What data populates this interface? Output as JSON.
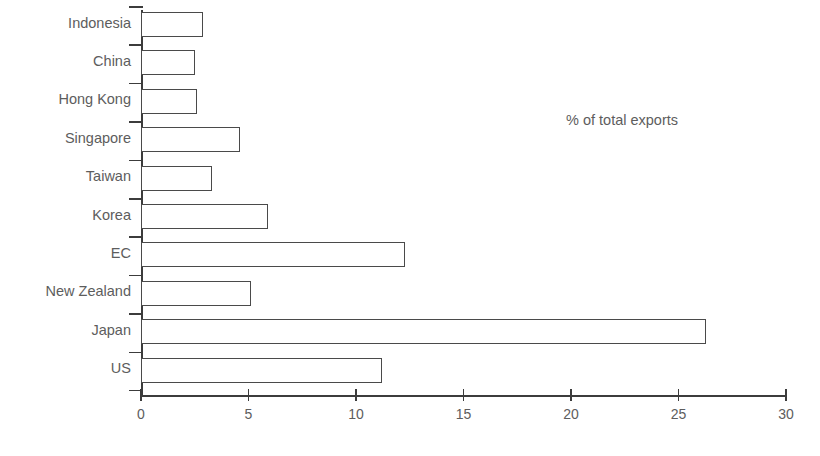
{
  "chart_data": {
    "type": "bar",
    "orientation": "horizontal",
    "title": "",
    "xlabel": "",
    "ylabel": "",
    "annotation": "% of total exports",
    "xlim": [
      0,
      30
    ],
    "xticks": [
      0,
      5,
      10,
      15,
      20,
      25,
      30
    ],
    "xtick_labels": [
      "0",
      "5",
      "10",
      "15",
      "20",
      "25",
      "30"
    ],
    "grid": false,
    "legend": false,
    "categories": [
      "Indonesia",
      "China",
      "Hong Kong",
      "Singapore",
      "Taiwan",
      "Korea",
      "EC",
      "New Zealand",
      "Japan",
      "US"
    ],
    "values": [
      2.9,
      2.5,
      2.6,
      4.6,
      3.3,
      5.9,
      12.3,
      5.1,
      26.3,
      11.2
    ],
    "series": [
      {
        "name": "% of total exports",
        "values": [
          2.9,
          2.5,
          2.6,
          4.6,
          3.3,
          5.9,
          12.3,
          5.1,
          26.3,
          11.2
        ]
      }
    ]
  },
  "style": {
    "background": "#ffffff",
    "line_color": "#3c3c3c",
    "bar_edge_color": "#4a4a4a",
    "bar_fill_color": "#ffffff",
    "text_color": "#5d5d5d"
  },
  "title_remnant": ""
}
